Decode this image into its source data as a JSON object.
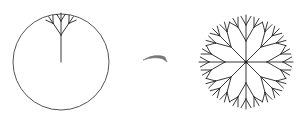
{
  "figure": {
    "colors": {
      "background": "#ffffff",
      "stroke": "#222222",
      "circle": "#555555",
      "arrow": "#777777"
    },
    "left": {
      "label": "single-fractal-tree-in-circle",
      "circle": {
        "cx": 61,
        "cy": 62,
        "r": 48
      },
      "tree": {
        "root": [
          61,
          62
        ],
        "direction_deg": -90,
        "trunk_length": 27,
        "levels": [
          {
            "length": 14,
            "spread_deg": 34
          },
          {
            "length": 8,
            "spread_deg": 32
          }
        ]
      }
    },
    "arrow": {
      "from": [
        143,
        59
      ],
      "to": [
        167,
        61
      ],
      "label": "transform-arrow"
    },
    "right": {
      "label": "radial-fractal-snowflake",
      "center": [
        246,
        62
      ],
      "spokes": 8,
      "start_angle_deg": -90,
      "tree": {
        "trunk_length": 21,
        "levels": [
          {
            "length": 16,
            "spread_deg": 30
          },
          {
            "length": 10,
            "spread_deg": 30
          }
        ]
      }
    }
  }
}
